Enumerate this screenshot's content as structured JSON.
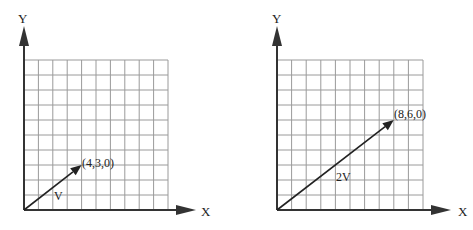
{
  "diagrams": [
    {
      "id": "left",
      "origin": [
        24,
        210
      ],
      "grid": {
        "cols": 10,
        "rows": 10,
        "cell_w": 14.4,
        "cell_h": 15.0
      },
      "axis_labels": {
        "x": "X",
        "y": "Y"
      },
      "vector": {
        "to": [
          4,
          3
        ],
        "label": "V",
        "coord_label": "(4,3,0)"
      }
    },
    {
      "id": "right",
      "origin": [
        277,
        210
      ],
      "grid": {
        "cols": 10,
        "rows": 10,
        "cell_w": 14.6,
        "cell_h": 15.0
      },
      "axis_labels": {
        "x": "X",
        "y": "Y"
      },
      "vector": {
        "to": [
          8,
          6
        ],
        "label": "2V",
        "coord_label": "(8,6,0)"
      }
    }
  ],
  "colors": {
    "grid": "#9a9a9a",
    "axis": "#333333",
    "vector": "#222222"
  }
}
